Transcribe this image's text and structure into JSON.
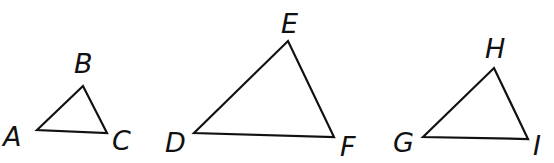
{
  "diagram": {
    "triangles": [
      {
        "name": "ABC",
        "points": "37,130 83,86 107,133",
        "labels": [
          {
            "text": "A",
            "x": 3,
            "y": 146
          },
          {
            "text": "B",
            "x": 74,
            "y": 73
          },
          {
            "text": "C",
            "x": 112,
            "y": 150
          }
        ]
      },
      {
        "name": "DEF",
        "points": "194,133 288,41 334,137",
        "labels": [
          {
            "text": "D",
            "x": 165,
            "y": 152
          },
          {
            "text": "E",
            "x": 281,
            "y": 33
          },
          {
            "text": "F",
            "x": 340,
            "y": 156
          }
        ]
      },
      {
        "name": "GHI",
        "points": "423,137 494,68 528,139",
        "labels": [
          {
            "text": "G",
            "x": 393,
            "y": 152
          },
          {
            "text": "H",
            "x": 485,
            "y": 58
          },
          {
            "text": "I",
            "x": 533,
            "y": 155
          }
        ]
      }
    ],
    "label_text": {
      "A": "A",
      "B": "B",
      "C": "C",
      "D": "D",
      "E": "E",
      "F": "F",
      "G": "G",
      "H": "H",
      "I": "I"
    },
    "stroke_color": "#111111",
    "background": "#ffffff"
  }
}
